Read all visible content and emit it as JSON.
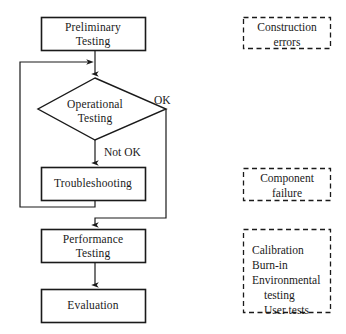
{
  "diagram": {
    "stroke_color": "#1a1a1a",
    "text_color": "#1a1a1a",
    "background_color": "#ffffff"
  },
  "nodes": {
    "preliminary": {
      "line1": "Preliminary",
      "line2": "Testing",
      "shape": "rectangle"
    },
    "operational": {
      "line1": "Operational",
      "line2": "Testing",
      "shape": "diamond"
    },
    "troubleshooting": {
      "line1": "Troubleshooting",
      "line2": "",
      "shape": "rectangle"
    },
    "performance": {
      "line1": "Performance",
      "line2": "Testing",
      "shape": "rectangle"
    },
    "evaluation": {
      "line1": "Evaluation",
      "line2": "",
      "shape": "rectangle"
    }
  },
  "edge_labels": {
    "ok": "OK",
    "not_ok": "Not OK"
  },
  "notes": [
    {
      "id": "construction-errors",
      "align": "center",
      "lines": [
        "Construction",
        "errors"
      ]
    },
    {
      "id": "component-failure",
      "align": "center",
      "lines": [
        "Component",
        "failure"
      ]
    },
    {
      "id": "test-types",
      "align": "left",
      "lines": [
        "Calibration",
        "Burn-in",
        "Environmental",
        "testing",
        "User tests"
      ]
    }
  ],
  "notes_text": {
    "construction_line1": "Construction",
    "construction_line2": "errors",
    "component_line1": "Component",
    "component_line2": "failure",
    "types_line1": "Calibration",
    "types_line2": "Burn-in",
    "types_line3": "Environmental",
    "types_line4": "testing",
    "types_line5": "User tests"
  }
}
